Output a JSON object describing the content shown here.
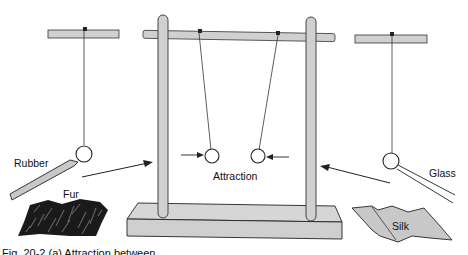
{
  "figure": {
    "labels": {
      "rubber": "Rubber",
      "fur": "Fur",
      "attraction": "Attraction",
      "glass": "Glass",
      "silk": "Silk"
    },
    "caption": "Fig. 20-2 (a) Attraction between"
  },
  "colors": {
    "rod_fill": "#d0d0d0",
    "stroke": "#222222",
    "fur": "#1a1a1a",
    "silk": "#c8c8c8"
  }
}
